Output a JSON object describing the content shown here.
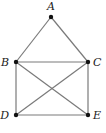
{
  "diagram": {
    "type": "graph",
    "colors": {
      "edge": "#7a7a7a",
      "node": "#111111",
      "label": "#222222"
    },
    "nodes": [
      {
        "id": "A",
        "label": "A",
        "x": 51,
        "y": 17,
        "lx": 51,
        "ly": 10,
        "anchor": "middle"
      },
      {
        "id": "B",
        "label": "B",
        "x": 16,
        "y": 62,
        "lx": 9,
        "ly": 66,
        "anchor": "end"
      },
      {
        "id": "C",
        "label": "C",
        "x": 88,
        "y": 62,
        "lx": 93,
        "ly": 66,
        "anchor": "start"
      },
      {
        "id": "D",
        "label": "D",
        "x": 16,
        "y": 115,
        "lx": 9,
        "ly": 119,
        "anchor": "end"
      },
      {
        "id": "E",
        "label": "E",
        "x": 88,
        "y": 115,
        "lx": 93,
        "ly": 119,
        "anchor": "start"
      }
    ],
    "edges": [
      [
        "A",
        "B"
      ],
      [
        "A",
        "C"
      ],
      [
        "B",
        "C"
      ],
      [
        "B",
        "D"
      ],
      [
        "C",
        "E"
      ],
      [
        "D",
        "E"
      ],
      [
        "B",
        "E"
      ],
      [
        "C",
        "D"
      ]
    ]
  }
}
